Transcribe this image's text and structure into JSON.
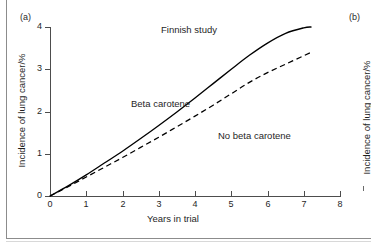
{
  "figure": {
    "panels": [
      {
        "id": "a",
        "label": "(a)"
      },
      {
        "id": "b",
        "label": "(b)"
      }
    ]
  },
  "chart_data": {
    "type": "line",
    "title": "Finnish study",
    "xlabel": "Years in trial",
    "ylabel": "Incidence of lung cancer/%",
    "xlim": [
      0,
      8
    ],
    "ylim": [
      0,
      4
    ],
    "xticks": [
      "0",
      "1",
      "2",
      "3",
      "4",
      "5",
      "6",
      "7",
      "8"
    ],
    "yticks": [
      "0",
      "1",
      "2",
      "3",
      "4"
    ],
    "grid": false,
    "legend_position": "inline-annotations",
    "series": [
      {
        "name": "Beta carotene",
        "style": "solid",
        "color": "#000000",
        "x": [
          0,
          0.5,
          1,
          1.5,
          2,
          2.5,
          3,
          3.5,
          4,
          4.5,
          5,
          5.5,
          6,
          6.5,
          7,
          7.2
        ],
        "values": [
          0,
          0.24,
          0.5,
          0.78,
          1.06,
          1.36,
          1.67,
          1.99,
          2.32,
          2.66,
          3.0,
          3.33,
          3.62,
          3.85,
          3.98,
          4.0
        ]
      },
      {
        "name": "No beta carotene",
        "style": "dashed",
        "color": "#000000",
        "x": [
          0,
          0.5,
          1,
          1.5,
          2,
          2.5,
          3,
          3.5,
          4,
          4.5,
          5,
          5.5,
          6,
          6.5,
          7,
          7.2
        ],
        "values": [
          0,
          0.22,
          0.45,
          0.68,
          0.91,
          1.15,
          1.39,
          1.64,
          1.89,
          2.15,
          2.42,
          2.69,
          2.92,
          3.12,
          3.32,
          3.4
        ]
      }
    ],
    "annotations": [
      {
        "text": "Finnish study",
        "x": 3.1,
        "y": 3.7
      },
      {
        "text": "Beta carotene",
        "x": 2.25,
        "y": 2.2
      },
      {
        "text": "No beta carotene",
        "x": 4.65,
        "y": 1.6
      }
    ]
  },
  "panel_b": {
    "ylabel": "Incidence of lung cancer/%"
  }
}
